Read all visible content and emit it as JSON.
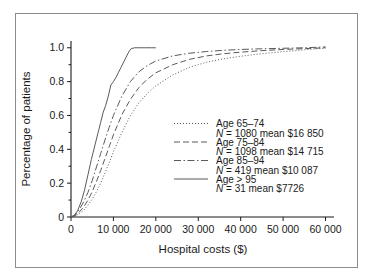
{
  "chart_data": {
    "type": "line",
    "title": "",
    "xlabel": "Hospital costs ($)",
    "ylabel": "Percentage of patients",
    "xlim": [
      0,
      62000
    ],
    "ylim": [
      0,
      1.04
    ],
    "grid": false,
    "legend_position": "center-right",
    "xticks": [
      0,
      10000,
      20000,
      30000,
      40000,
      50000,
      60000
    ],
    "xticklabels": [
      "0",
      "10 000",
      "20 000",
      "30 000",
      "40 000",
      "50 000",
      "60 000"
    ],
    "yticks": [
      0,
      0.2,
      0.4,
      0.6,
      0.8,
      1.0
    ],
    "yticklabels": [
      "0",
      "0.2",
      "0.4",
      "0.6",
      "0.8",
      "1.0"
    ],
    "series": [
      {
        "name": "Age 65–74",
        "label": "Age 65–74",
        "detail": "N = 1080 mean $16 850",
        "n": 1080,
        "mean": 16850,
        "linestyle": "dotted",
        "dasharray": "1,2",
        "x": [
          0,
          1000,
          2000,
          3000,
          4000,
          5000,
          6000,
          7000,
          8000,
          9000,
          10000,
          12000,
          14000,
          16000,
          18000,
          20000,
          24000,
          28000,
          32000,
          36000,
          40000,
          45000,
          50000,
          55000,
          60000
        ],
        "y": [
          0,
          0.005,
          0.02,
          0.04,
          0.07,
          0.105,
          0.15,
          0.2,
          0.26,
          0.32,
          0.385,
          0.5,
          0.6,
          0.675,
          0.73,
          0.775,
          0.84,
          0.885,
          0.915,
          0.935,
          0.95,
          0.965,
          0.977,
          0.988,
          0.998
        ]
      },
      {
        "name": "Age 75–84",
        "label": "Age 75–84",
        "detail": "N = 1098 mean $14 715",
        "n": 1098,
        "mean": 14715,
        "linestyle": "dashed",
        "dasharray": "6,3",
        "x": [
          0,
          1000,
          2000,
          3000,
          4000,
          5000,
          6000,
          7000,
          8000,
          9000,
          10000,
          12000,
          14000,
          16000,
          18000,
          20000,
          24000,
          28000,
          32000,
          36000,
          40000,
          45000,
          50000,
          55000,
          60000
        ],
        "y": [
          0,
          0.008,
          0.03,
          0.06,
          0.1,
          0.15,
          0.21,
          0.275,
          0.345,
          0.415,
          0.485,
          0.605,
          0.695,
          0.765,
          0.815,
          0.852,
          0.9,
          0.932,
          0.952,
          0.965,
          0.974,
          0.983,
          0.99,
          0.995,
          1.0
        ]
      },
      {
        "name": "Age 85–94",
        "label": "Age 85–94",
        "detail": "N = 419 mean $10 087",
        "n": 419,
        "mean": 10087,
        "linestyle": "dashdot",
        "dasharray": "7,2.5,1.5,2.5",
        "x": [
          0,
          1000,
          2000,
          3000,
          4000,
          5000,
          6000,
          7000,
          8000,
          9000,
          10000,
          12000,
          14000,
          16000,
          18000,
          20000,
          24000,
          28000,
          32000,
          36000,
          40000,
          45000,
          50000,
          55000,
          60000
        ],
        "y": [
          0,
          0.012,
          0.045,
          0.09,
          0.145,
          0.215,
          0.295,
          0.375,
          0.455,
          0.53,
          0.6,
          0.715,
          0.8,
          0.858,
          0.895,
          0.922,
          0.952,
          0.968,
          0.978,
          0.985,
          0.99,
          0.994,
          0.997,
          1.0,
          1.005
        ]
      },
      {
        "name": "Age > 95",
        "label": "Age > 95",
        "detail": "N = 31 mean $7726",
        "n": 31,
        "mean": 7726,
        "linestyle": "solid",
        "dasharray": "",
        "x": [
          0,
          800,
          1600,
          2400,
          3200,
          4000,
          4800,
          5600,
          6400,
          7000,
          7600,
          8200,
          8800,
          9400,
          10000,
          10600,
          11200,
          11800,
          12400,
          13000,
          13600,
          14200,
          15000,
          16000,
          17500,
          19000,
          20000
        ],
        "y": [
          0,
          0.01,
          0.04,
          0.09,
          0.16,
          0.25,
          0.34,
          0.42,
          0.5,
          0.56,
          0.62,
          0.66,
          0.715,
          0.78,
          0.8,
          0.825,
          0.855,
          0.885,
          0.915,
          0.945,
          0.975,
          0.995,
          1.0,
          1.0,
          1.0,
          1.0,
          1.0
        ]
      }
    ]
  },
  "colors": {
    "line": "#5a5a5a",
    "axis": "#1a1a1a",
    "frame": "#8c8c8c",
    "background": "#ffffff"
  }
}
